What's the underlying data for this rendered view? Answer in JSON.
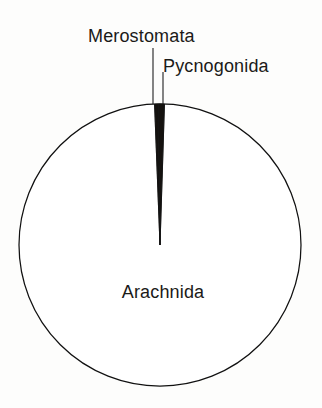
{
  "figure": {
    "background_color": "#fdfdfc",
    "line_color": "#141414",
    "text_color": "#1b1a18",
    "width": 322,
    "height": 408
  },
  "chart_data": {
    "type": "pie",
    "title": "",
    "subtitle": "",
    "xlabel": "",
    "ylabel": "",
    "grid": false,
    "legend_position": "none",
    "label_style": "leader-lines-outside",
    "center": {
      "x": 160,
      "y": 245
    },
    "radius": 141,
    "start_angle_deg": -90,
    "direction": "clockwise",
    "categories": [
      "Arachnida",
      "Merostomata",
      "Pycnogonida"
    ],
    "values": [
      99.2,
      0.4,
      0.4
    ],
    "value_unit": "percent",
    "slices": [
      {
        "label": "Arachnida",
        "value": 99.2,
        "start_angle_deg": -88.2,
        "end_angle_deg": 271.8,
        "fill": "#ffffff",
        "label_placement": "inside"
      },
      {
        "label": "Merostomata",
        "value": 0.4,
        "start_angle_deg": -92.2,
        "end_angle_deg": -90.7,
        "fill": "#15120f",
        "label_placement": "outside"
      },
      {
        "label": "Pycnogonida",
        "value": 0.4,
        "start_angle_deg": -90.7,
        "end_angle_deg": -88.2,
        "fill": "#15120f",
        "label_placement": "outside"
      }
    ],
    "annotations": [
      {
        "text": "Merostomata",
        "x": 88,
        "y": 27,
        "leader_from": [
          153,
          48
        ],
        "leader_to": [
          153,
          104
        ]
      },
      {
        "text": "Pycnogonida",
        "x": 163,
        "y": 57,
        "leader_from": [
          163,
          72
        ],
        "leader_to": [
          163,
          104
        ]
      },
      {
        "text": "Arachnida",
        "x": 162,
        "y": 295,
        "leader_from": null,
        "leader_to": null
      }
    ]
  },
  "labels": {
    "merostomata": "Merostomata",
    "pycnogonida": "Pycnogonida",
    "arachnida": "Arachnida"
  }
}
